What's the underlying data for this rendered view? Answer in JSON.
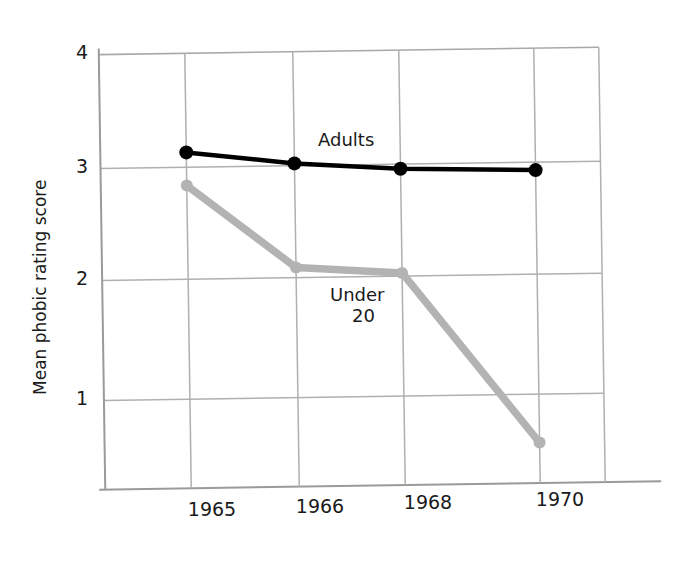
{
  "chart_data": {
    "type": "line",
    "title": "",
    "subtitle": "",
    "xlabel": "",
    "ylabel": "Mean phobic rating score",
    "x": [
      "1965",
      "1966",
      "1968",
      "1970"
    ],
    "categories": [
      "1965",
      "1966",
      "1968",
      "1970"
    ],
    "xtick_labels": [
      "1965",
      "1966",
      "1968",
      "1970"
    ],
    "ytick_labels": [
      "1",
      "2",
      "3",
      "4"
    ],
    "ylim": [
      0,
      4
    ],
    "xlim": [
      1964.2,
      1971.3
    ],
    "yticks": [
      1,
      2,
      3,
      4
    ],
    "grid": "both",
    "legend": "inline-annotations",
    "series": [
      {
        "name": "Adults",
        "label": "Adults",
        "color": "#000000",
        "marker": "circle",
        "values": [
          3.13,
          3.02,
          2.96,
          2.93
        ]
      },
      {
        "name": "Under 20",
        "label": "Under\n20",
        "label_line1": "Under",
        "label_line2": "20",
        "color": "#b3b3b3",
        "marker": "circle",
        "values": [
          2.84,
          2.11,
          2.05,
          0.55
        ]
      }
    ],
    "annotations": [
      {
        "text": "Adults",
        "series": "Adults"
      },
      {
        "text": "Under",
        "series": "Under 20"
      },
      {
        "text": "20",
        "series": "Under 20"
      }
    ]
  },
  "axes": {
    "y_title": "Mean phobic rating score",
    "y_tick_4": "4",
    "y_tick_3": "3",
    "y_tick_2": "2",
    "y_tick_1": "1",
    "x_tick_1965": "1965",
    "x_tick_1966": "1966",
    "x_tick_1968": "1968",
    "x_tick_1970": "1970"
  },
  "labels": {
    "adults": "Adults",
    "under": "Under",
    "twenty": "20"
  },
  "colors": {
    "adults_line": "#000000",
    "under20_line": "#b3b3b3",
    "grid": "#aaaaaa",
    "axis": "#8c8c8c",
    "text": "#1a1a1a",
    "background": "#ffffff"
  }
}
